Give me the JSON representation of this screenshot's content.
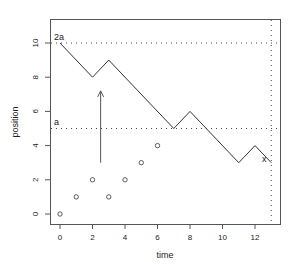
{
  "chart_data": {
    "type": "line",
    "title": "",
    "xlabel": "time",
    "ylabel": "position",
    "xlim": [
      -0.5,
      13.5
    ],
    "ylim": [
      -0.4,
      11.0
    ],
    "x_ticks": [
      0,
      2,
      4,
      6,
      8,
      10,
      12
    ],
    "y_ticks": [
      0,
      2,
      4,
      6,
      8,
      10
    ],
    "grid": false,
    "series": [
      {
        "name": "path",
        "type": "line",
        "x": [
          0,
          2,
          3,
          7,
          8,
          11,
          12,
          13
        ],
        "y": [
          10,
          8,
          9,
          5,
          6,
          3,
          4,
          3
        ]
      },
      {
        "name": "points",
        "type": "scatter",
        "marker": "o",
        "x": [
          0,
          1,
          2,
          3,
          4,
          5,
          6
        ],
        "y": [
          0,
          1,
          2,
          1,
          2,
          3,
          4
        ]
      }
    ],
    "reference_lines": [
      {
        "orientation": "horizontal",
        "value": 10,
        "style": "dotted",
        "label": "2a"
      },
      {
        "orientation": "horizontal",
        "value": 5,
        "style": "dotted",
        "label": "a"
      },
      {
        "orientation": "vertical",
        "value": 13,
        "style": "dotted"
      }
    ],
    "annotations": [
      {
        "text": "2a",
        "x": 0,
        "y": 10.4
      },
      {
        "text": "a",
        "x": 0,
        "y": 5.4
      },
      {
        "text": "x",
        "x": 12.7,
        "y": 3.2
      },
      {
        "type": "arrow",
        "from": [
          2.5,
          3.0
        ],
        "to": [
          2.5,
          7.2
        ]
      }
    ]
  },
  "labels": {
    "xlabel": "time",
    "ylabel": "position",
    "x_ticks": [
      "0",
      "2",
      "4",
      "6",
      "8",
      "10",
      "12"
    ],
    "y_ticks": [
      "0",
      "2",
      "4",
      "6",
      "8",
      "10"
    ],
    "ann_2a": "2a",
    "ann_a": "a",
    "ann_x": "x"
  }
}
